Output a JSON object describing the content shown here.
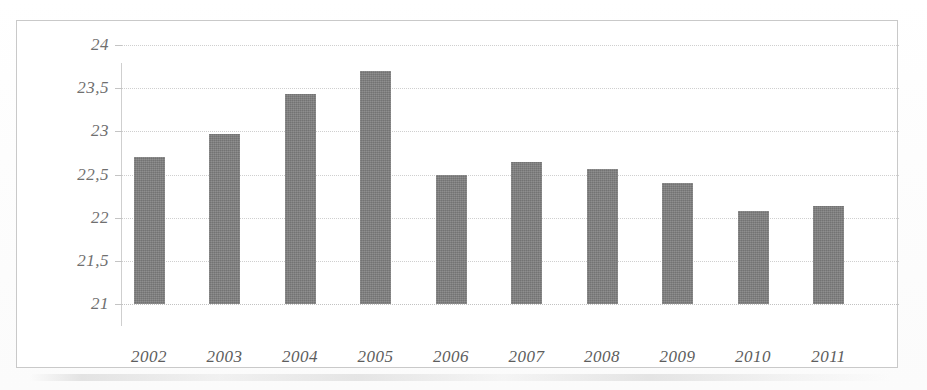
{
  "chart_data": {
    "type": "bar",
    "title": "",
    "subtitle": "",
    "xlabel": "",
    "ylabel": "",
    "categories": [
      "2002",
      "2003",
      "2004",
      "2005",
      "2006",
      "2007",
      "2008",
      "2009",
      "2010",
      "2011"
    ],
    "values": [
      22.7,
      22.97,
      23.43,
      23.7,
      22.49,
      22.64,
      22.56,
      22.4,
      22.08,
      22.13
    ],
    "ytick_labels": [
      "24",
      "23,5",
      "23",
      "22,5",
      "22",
      "21,5",
      "21"
    ],
    "ytick_values": [
      24,
      23.5,
      23,
      22.5,
      22,
      21.5,
      21
    ],
    "ylim": [
      21,
      24
    ],
    "grid": true,
    "legend": false,
    "legend_position": "none",
    "series": [
      {
        "name": "",
        "color": "#7e7e7e",
        "points": [
          {
            "category": "2002",
            "value": 22.7
          },
          {
            "category": "2003",
            "value": 22.97
          },
          {
            "category": "2004",
            "value": 23.43
          },
          {
            "category": "2005",
            "value": 23.7
          },
          {
            "category": "2006",
            "value": 22.49
          },
          {
            "category": "2007",
            "value": 22.64
          },
          {
            "category": "2008",
            "value": 22.56
          },
          {
            "category": "2009",
            "value": 22.4
          },
          {
            "category": "2010",
            "value": 22.08
          },
          {
            "category": "2011",
            "value": 22.13
          }
        ]
      }
    ],
    "colors": {
      "bar": "#7e7e7e",
      "gridline": "#cfcfcf",
      "axis": "#c9c9c9",
      "tick_label": "#6f6f6f",
      "category_label": "#5d5d5d",
      "background": "#ffffff",
      "frame": "#c9c9c9"
    }
  }
}
